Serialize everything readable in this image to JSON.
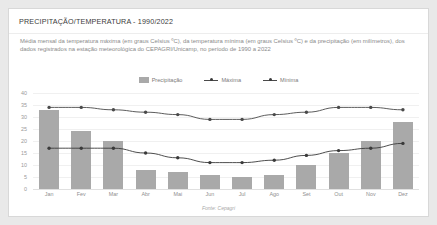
{
  "card": {
    "title": "PRECIPITAÇÃO/TEMPERATURA - 1990/2022",
    "description": "Média mensal da temperatura máxima (em graus Celsius ºC), da temperatura mínima (em graus Celsius ºC) e da precipitação (em milímetros), dos dados registrados na estação meteorológica do CEPAGRI/Unicamp, no período de 1990 a 2022",
    "source": "Fonte: Cepagri"
  },
  "legend": [
    {
      "label": "Precipitação",
      "type": "bar",
      "color": "#a9a9a9"
    },
    {
      "label": "Máxima",
      "type": "line",
      "color": "#4a4a4a"
    },
    {
      "label": "Mínima",
      "type": "line",
      "color": "#3a3a3a"
    }
  ],
  "chart_data": {
    "type": "bar",
    "title": "PRECIPITAÇÃO/TEMPERATURA - 1990/2022",
    "xlabel": "",
    "ylabel": "",
    "ylim": [
      0,
      40
    ],
    "yticks": [
      40,
      35,
      30,
      25,
      20,
      15,
      10,
      5,
      0
    ],
    "grid": true,
    "legend_position": "top-center",
    "categories": [
      "Jan",
      "Fev",
      "Mar",
      "Abr",
      "Mai",
      "Jun",
      "Jul",
      "Ago",
      "Set",
      "Out",
      "Nov",
      "Dez"
    ],
    "series": [
      {
        "name": "Precipitação",
        "type": "bar",
        "color": "#a9a9a9",
        "values": [
          33,
          24,
          20,
          8,
          7,
          6,
          5,
          6,
          10,
          15,
          20,
          28
        ]
      },
      {
        "name": "Máxima",
        "type": "line",
        "color": "#4a4a4a",
        "values": [
          34,
          34,
          33,
          32,
          31,
          29,
          29,
          31,
          32,
          34,
          34,
          33
        ]
      },
      {
        "name": "Mínima",
        "type": "line",
        "color": "#3a3a3a",
        "values": [
          17,
          17,
          17,
          15,
          13,
          11,
          11,
          12,
          14,
          16,
          17,
          19
        ]
      }
    ]
  }
}
